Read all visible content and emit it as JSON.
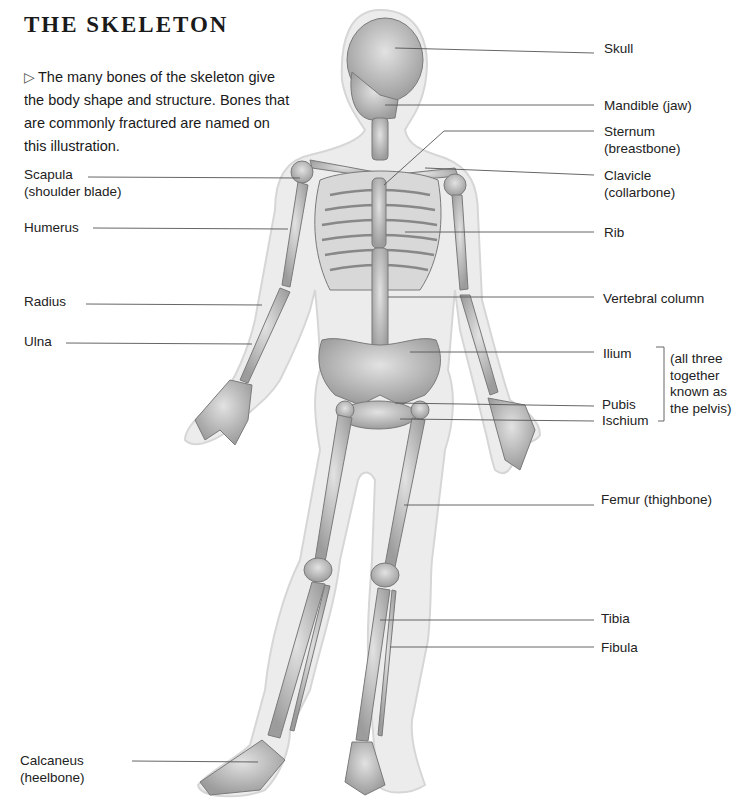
{
  "title": "THE SKELETON",
  "intro": {
    "icon": "triangle-right-outline-icon",
    "text": "The many bones of the skeleton give the body shape and structure. Bones that are commonly fractured are named on this illustration."
  },
  "labels_left": [
    {
      "id": "scapula",
      "line1": "Scapula",
      "line2": "(shoulder blade)"
    },
    {
      "id": "humerus",
      "line1": "Humerus",
      "line2": ""
    },
    {
      "id": "radius",
      "line1": "Radius",
      "line2": ""
    },
    {
      "id": "ulna",
      "line1": "Ulna",
      "line2": ""
    },
    {
      "id": "calcaneus",
      "line1": "Calcaneus",
      "line2": "(heelbone)"
    }
  ],
  "labels_right": [
    {
      "id": "skull",
      "line1": "Skull",
      "line2": ""
    },
    {
      "id": "mandible",
      "line1": "Mandible (jaw)",
      "line2": ""
    },
    {
      "id": "sternum",
      "line1": "Sternum",
      "line2": "(breastbone)"
    },
    {
      "id": "clavicle",
      "line1": "Clavicle",
      "line2": "(collarbone)"
    },
    {
      "id": "rib",
      "line1": "Rib",
      "line2": ""
    },
    {
      "id": "vertebral-column",
      "line1": "Vertebral column",
      "line2": ""
    },
    {
      "id": "ilium",
      "line1": "Ilium",
      "line2": ""
    },
    {
      "id": "pubis",
      "line1": "Pubis",
      "line2": ""
    },
    {
      "id": "ischium",
      "line1": "Ischium",
      "line2": ""
    },
    {
      "id": "femur",
      "line1": "Femur (thighbone)",
      "line2": ""
    },
    {
      "id": "tibia",
      "line1": "Tibia",
      "line2": ""
    },
    {
      "id": "fibula",
      "line1": "Fibula",
      "line2": ""
    }
  ],
  "pelvis_note": {
    "line1": "(all three",
    "line2": "together",
    "line3": "known as",
    "line4": "the pelvis)"
  },
  "colors": {
    "body_outline": "#e6e6e6",
    "bone": "#c9c9c9",
    "bone_dark": "#8a8a8a",
    "leader_line": "#555555"
  }
}
